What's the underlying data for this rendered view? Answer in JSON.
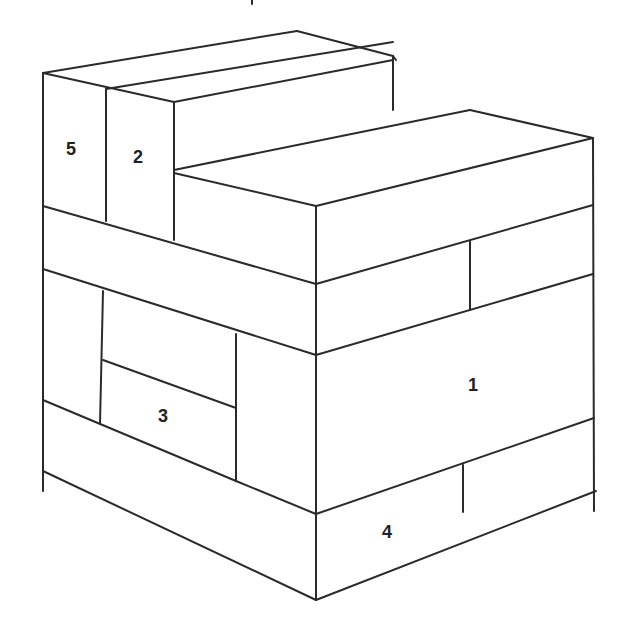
{
  "diagram": {
    "type": "isometric-block-stack",
    "stroke_color": "#2a2a2a",
    "background": "#ffffff",
    "labels": [
      {
        "id": "block-5",
        "text": "5",
        "x": 71,
        "y": 150
      },
      {
        "id": "block-2",
        "text": "2",
        "x": 138,
        "y": 158
      },
      {
        "id": "block-3",
        "text": "3",
        "x": 163,
        "y": 417
      },
      {
        "id": "block-1",
        "text": "1",
        "x": 473,
        "y": 386
      },
      {
        "id": "block-4",
        "text": "4",
        "x": 387,
        "y": 533
      }
    ],
    "tick_mark": {
      "x1": 252,
      "y1": 0,
      "x2": 252,
      "y2": 4
    },
    "lines": [
      [
        43,
        73,
        297,
        31
      ],
      [
        297,
        31,
        393,
        56
      ],
      [
        43,
        73,
        174,
        102
      ],
      [
        106,
        89,
        393,
        42
      ],
      [
        174,
        102,
        393,
        60
      ],
      [
        393,
        56,
        396,
        60
      ],
      [
        43,
        73,
        43,
        206
      ],
      [
        106,
        89,
        106,
        221
      ],
      [
        174,
        102,
        174,
        240
      ],
      [
        393,
        56,
        393,
        110
      ],
      [
        174,
        170,
        470,
        110
      ],
      [
        470,
        110,
        593,
        138
      ],
      [
        174,
        173,
        316,
        206
      ],
      [
        316,
        206,
        593,
        138
      ],
      [
        593,
        138,
        594,
        511
      ],
      [
        316,
        206,
        316,
        600
      ],
      [
        43,
        206,
        316,
        284
      ],
      [
        316,
        284,
        593,
        205
      ],
      [
        470,
        241,
        470,
        310
      ],
      [
        316,
        355,
        593,
        274
      ],
      [
        43,
        206,
        43,
        491
      ],
      [
        43,
        269,
        316,
        355
      ],
      [
        103,
        291,
        100,
        424
      ],
      [
        103,
        360,
        236,
        408
      ],
      [
        236,
        334,
        236,
        481
      ],
      [
        43,
        400,
        236,
        481
      ],
      [
        236,
        481,
        316,
        514
      ],
      [
        316,
        514,
        594,
        418
      ],
      [
        463,
        465,
        463,
        512
      ],
      [
        43,
        471,
        316,
        600
      ],
      [
        316,
        600,
        596,
        491
      ]
    ]
  }
}
